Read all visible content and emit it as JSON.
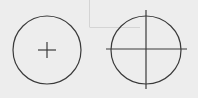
{
  "diagram": {
    "colors": {
      "background": "#ededed",
      "stroke": "#3a3a3a",
      "faint_line": "#d4d4d4"
    },
    "background_guides": {
      "vertical_x": 89,
      "horizontal_y": 27,
      "horizontal_x_end": 140
    },
    "left_circle": {
      "cx": 47,
      "cy": 50,
      "r": 34,
      "center_mark": {
        "half_w": 9,
        "half_h": 8
      }
    },
    "right_circle": {
      "cx": 146,
      "cy": 50,
      "rx": 35,
      "ry": 34,
      "centerline_h": {
        "x1": 106,
        "x2": 187,
        "y": 49
      },
      "centerline_v": {
        "x": 146,
        "y1": 10,
        "y2": 89
      }
    }
  }
}
